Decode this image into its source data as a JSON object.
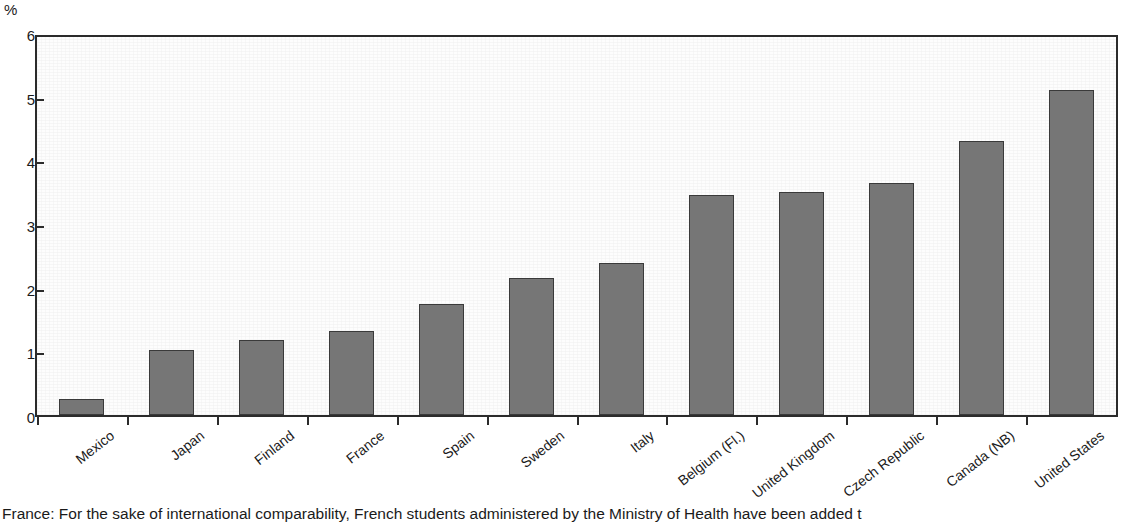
{
  "chart_data": {
    "type": "bar",
    "title": "",
    "xlabel": "",
    "ylabel": "%",
    "unit_label": "%",
    "ylim": [
      0,
      6
    ],
    "ytick_labels": [
      "6",
      "5",
      "4",
      "3",
      "2",
      "1",
      "0"
    ],
    "ytick_values": [
      6,
      5,
      4,
      3,
      2,
      1,
      0
    ],
    "grid": false,
    "legend": "none",
    "bar_color": "#767676",
    "bar_edge_color": "#3a3a3a",
    "axis_color": "#2b2b2b",
    "categories": [
      "Mexico",
      "Japan",
      "Finland",
      "France",
      "Spain",
      "Sweden",
      "Italy",
      "Belgium (Fl.)",
      "United Kingdom",
      "Czech Republic",
      "Canada (NB)",
      "United States"
    ],
    "values": [
      0.25,
      1.03,
      1.19,
      1.34,
      1.76,
      2.18,
      2.41,
      3.5,
      3.54,
      3.69,
      4.35,
      5.16
    ]
  },
  "footnote": {
    "text": "France: For the sake of international comparability, French students administered by the Ministry of Health have been added t"
  }
}
